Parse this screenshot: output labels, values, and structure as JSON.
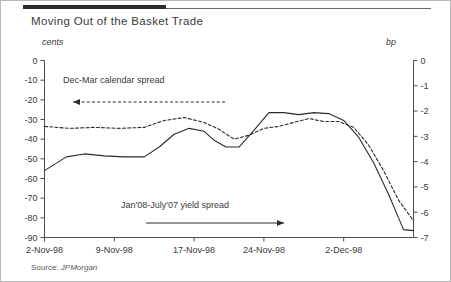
{
  "figure": {
    "title": "Moving Out of the Basket Trade",
    "source_prefix": "Source:",
    "source_publisher": "JPMorgan"
  },
  "chart_data": {
    "type": "line",
    "title": "Moving Out of the Basket Trade",
    "xlabel": "",
    "ylabel": "cents",
    "y2label": "bp",
    "grid": false,
    "legend": "annotations-inline",
    "x_tick_labels": [
      "2-Nov-98",
      "9-Nov-98",
      "17-Nov-98",
      "24-Nov-98",
      "2-Dec-98"
    ],
    "x_tick_positions": [
      0,
      7,
      15,
      22,
      30
    ],
    "xlim": [
      0,
      37
    ],
    "ylim": [
      -90,
      0
    ],
    "y_tick_labels": [
      "0",
      "-10",
      "-20",
      "-30",
      "-40",
      "-50",
      "-60",
      "-70",
      "-80",
      "-90"
    ],
    "y_tick_values": [
      0,
      -10,
      -20,
      -30,
      -40,
      -50,
      -60,
      -70,
      -80,
      -90
    ],
    "y2lim": [
      -7,
      0
    ],
    "y2_tick_labels": [
      "0",
      "-1",
      "-2",
      "-3",
      "-4",
      "-5",
      "-6",
      "-7"
    ],
    "y2_tick_values": [
      0,
      -1,
      -2,
      -3,
      -4,
      -5,
      -6,
      -7
    ],
    "series": [
      {
        "name": "Jan'08-July'07 yield spread",
        "style": "solid",
        "axis": "left",
        "color": "#2b2b2b",
        "x": [
          0,
          2.2,
          4.0,
          6.0,
          8.0,
          10.0,
          11.5,
          13.0,
          14.5,
          16.0,
          17.0,
          18.2,
          19.5,
          21.0,
          22.5,
          24.0,
          25.5,
          27.0,
          28.5,
          30.0,
          31.5,
          33.0,
          34.5,
          36.0,
          37.0
        ],
        "y": [
          -56.0,
          -49.0,
          -47.5,
          -48.5,
          -49.0,
          -49.0,
          -44.0,
          -37.5,
          -34.5,
          -36.0,
          -40.5,
          -44.0,
          -44.0,
          -35.5,
          -26.5,
          -26.5,
          -27.5,
          -26.5,
          -27.0,
          -30.5,
          -39.0,
          -52.0,
          -68.0,
          -86.0,
          -86.5
        ]
      },
      {
        "name": "Dec-Mar calendar spread",
        "style": "dashed",
        "axis": "right",
        "color": "#2b2b2b",
        "x": [
          0,
          2.5,
          5.0,
          7.5,
          10.0,
          12.0,
          14.0,
          16.0,
          17.5,
          19.0,
          20.5,
          22.0,
          23.5,
          25.0,
          26.5,
          28.0,
          29.5,
          31.0,
          32.5,
          34.0,
          35.5,
          37.0
        ],
        "y": [
          -33.5,
          -34.5,
          -34.0,
          -34.5,
          -34.0,
          -30.5,
          -29.0,
          -31.5,
          -35.0,
          -40.0,
          -38.0,
          -34.5,
          -33.5,
          -31.5,
          -29.5,
          -31.0,
          -31.0,
          -34.0,
          -43.0,
          -56.0,
          -71.0,
          -81.5
        ]
      }
    ],
    "annotations": [
      {
        "text": "Dec-Mar calendar spread",
        "text_x": 62,
        "text_y": 82,
        "arrow": {
          "x1": 224,
          "y1": 101,
          "x2": 72,
          "y2": 101,
          "style": "dashed",
          "head": "left"
        }
      },
      {
        "text": "Jan'08-July'07 yield spread",
        "text_x": 120,
        "text_y": 207,
        "arrow": {
          "x1": 145,
          "y1": 222,
          "x2": 283,
          "y2": 222,
          "style": "solid",
          "head": "right"
        }
      }
    ]
  }
}
